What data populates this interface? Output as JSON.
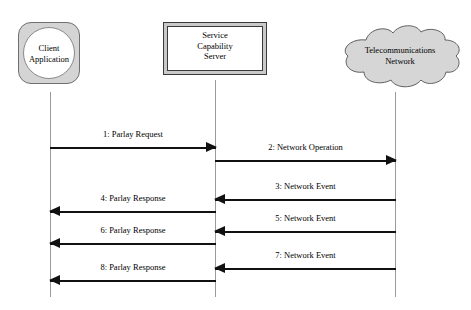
{
  "diagram": {
    "type": "uml-sequence-diagram",
    "background_color": "#ffffff",
    "line_color": "#111111",
    "lifeline_color": "#9a9a9a",
    "shape_fill_color": "#d4d4d4"
  },
  "participants": [
    {
      "id": "client",
      "label": "Client\nApplication",
      "shape": "rounded-square-with-circle",
      "lifeline_x": 50
    },
    {
      "id": "scs",
      "label": "Service\nCapability\nServer",
      "shape": "beveled-rectangle",
      "lifeline_x": 215
    },
    {
      "id": "network",
      "label": "Telecommunications\nNetwork",
      "shape": "cloud",
      "lifeline_x": 395
    }
  ],
  "messages": [
    {
      "seq": 1,
      "label": "1: Parlay Request",
      "from": "client",
      "to": "scs",
      "direction": "right",
      "y": 142
    },
    {
      "seq": 2,
      "label": "2: Network Operation",
      "from": "scs",
      "to": "network",
      "direction": "right",
      "y": 155
    },
    {
      "seq": 3,
      "label": "3: Network Event",
      "from": "network",
      "to": "scs",
      "direction": "left",
      "y": 194
    },
    {
      "seq": 4,
      "label": "4: Parlay Response",
      "from": "scs",
      "to": "client",
      "direction": "left",
      "y": 206
    },
    {
      "seq": 5,
      "label": "5: Network Event",
      "from": "network",
      "to": "scs",
      "direction": "left",
      "y": 226
    },
    {
      "seq": 6,
      "label": "6: Parlay Response",
      "from": "scs",
      "to": "client",
      "direction": "left",
      "y": 238
    },
    {
      "seq": 7,
      "label": "7: Network Event",
      "from": "network",
      "to": "scs",
      "direction": "left",
      "y": 263
    },
    {
      "seq": 8,
      "label": "8: Parlay Response",
      "from": "scs",
      "to": "client",
      "direction": "left",
      "y": 275
    }
  ]
}
